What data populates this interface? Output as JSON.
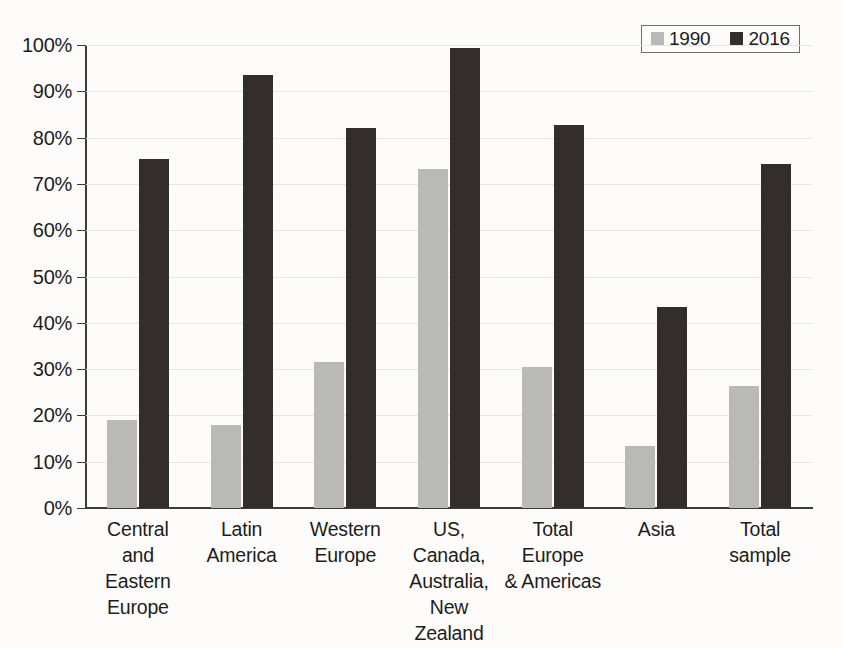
{
  "chart_data": {
    "type": "bar",
    "title": "",
    "subtitle": "",
    "xlabel": "",
    "ylabel": "",
    "ylim": [
      0,
      100
    ],
    "y_unit": "%",
    "grid": true,
    "legend_position": "top-right",
    "categories": [
      "Central\nand\nEastern\nEurope",
      "Latin\nAmerica",
      "Western\nEurope",
      "US,\nCanada,\nAustralia,\nNew Zealand",
      "Total Europe\n& Americas",
      "Asia",
      "Total\nsample"
    ],
    "ytick_labels": [
      "0%",
      "10%",
      "20%",
      "30%",
      "40%",
      "50%",
      "60%",
      "70%",
      "80%",
      "90%",
      "100%"
    ],
    "ytick_values": [
      0,
      10,
      20,
      30,
      40,
      50,
      60,
      70,
      80,
      90,
      100
    ],
    "series": [
      {
        "name": "1990",
        "color": "#b9b9b7",
        "values": [
          19.0,
          18.0,
          31.5,
          73.3,
          30.5,
          13.3,
          26.3
        ]
      },
      {
        "name": "2016",
        "color": "#332e2b",
        "values": [
          75.4,
          93.6,
          82.1,
          99.3,
          82.7,
          43.5,
          74.3
        ]
      }
    ]
  },
  "legend": {
    "items": [
      {
        "label": "1990",
        "color": "#b9b9b7"
      },
      {
        "label": "2016",
        "color": "#332e2b"
      }
    ]
  }
}
